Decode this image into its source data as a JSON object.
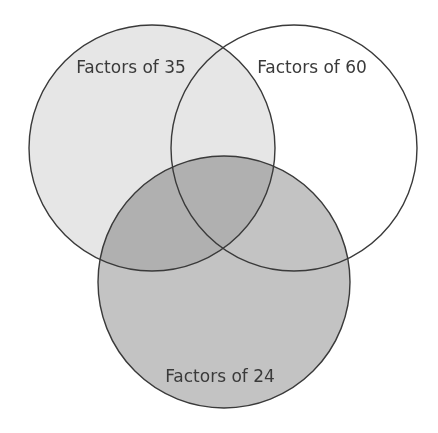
{
  "diagram": {
    "type": "venn",
    "sets": [
      {
        "id": "set-35",
        "label": "Factors of 35",
        "cx": 152,
        "cy": 148,
        "r": 123,
        "fill": "#e6e6e6",
        "label_x": 131,
        "label_y": 73
      },
      {
        "id": "set-60",
        "label": "Factors of 60",
        "cx": 294,
        "cy": 148,
        "r": 123,
        "fill": "#ffffff",
        "label_x": 312,
        "label_y": 73
      },
      {
        "id": "set-24",
        "label": "Factors of 24",
        "cx": 224,
        "cy": 282,
        "r": 126,
        "fill": "#c3c3c3",
        "label_x": 220,
        "label_y": 382
      }
    ],
    "outline_color": "#3a3a3a",
    "background": "#ffffff"
  }
}
